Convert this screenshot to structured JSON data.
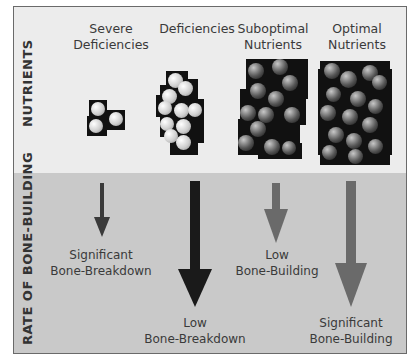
{
  "sections": {
    "top_label": "NUTRIENTS",
    "bottom_label": "RATE OF BONE-BUILDING"
  },
  "columns": [
    {
      "line1": "Severe",
      "line2": "Deficiencies",
      "ball_style": "light",
      "arrow_color": "#3a3a3a",
      "arrow_size": "small",
      "outcome_line1": "Significant",
      "outcome_line2": "Bone-Breakdown"
    },
    {
      "line1": "Deficiencies",
      "line2": "",
      "ball_style": "light",
      "arrow_color": "#1a1a1a",
      "arrow_size": "large",
      "outcome_line1": "Low",
      "outcome_line2": "Bone-Breakdown"
    },
    {
      "line1": "Suboptimal",
      "line2": "Nutrients",
      "ball_style": "dark",
      "arrow_color": "#6a6a6a",
      "arrow_size": "small",
      "outcome_line1": "Low",
      "outcome_line2": "Bone-Building"
    },
    {
      "line1": "Optimal",
      "line2": "Nutrients",
      "ball_style": "dark",
      "arrow_color": "#6a6a6a",
      "arrow_size": "large",
      "outcome_line1": "Significant",
      "outcome_line2": "Bone-Building"
    }
  ],
  "colors": {
    "top_panel": "#ececec",
    "bottom_panel": "#c9c9c9",
    "border": "#6a6a6a",
    "block": "#111111"
  }
}
